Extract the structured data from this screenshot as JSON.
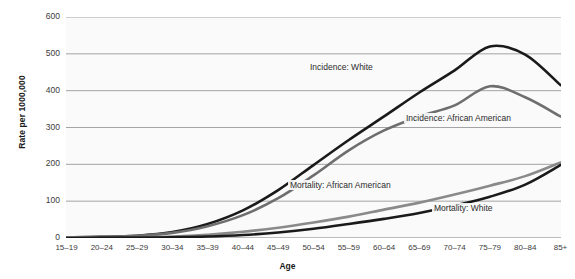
{
  "chart_data": {
    "type": "line",
    "title": "",
    "xlabel": "Age",
    "ylabel": "Rate per 1000,000",
    "categories": [
      "15–19",
      "20–24",
      "25–29",
      "30–34",
      "35–39",
      "40–44",
      "45–49",
      "50–54",
      "55–59",
      "60–64",
      "65–69",
      "70–74",
      "75–79",
      "80–84",
      "85+"
    ],
    "ylim": [
      0,
      600
    ],
    "yticks": [
      0,
      100,
      200,
      300,
      400,
      500,
      600
    ],
    "grid": true,
    "legend_position": "inline-annotations",
    "series": [
      {
        "name": "Incidence: White",
        "color": "#1a1a1a",
        "values": [
          2,
          3,
          6,
          16,
          38,
          75,
          130,
          198,
          266,
          330,
          395,
          455,
          520,
          498,
          415
        ]
      },
      {
        "name": "Incidence: African American",
        "color": "#6e6e6e",
        "values": [
          2,
          3,
          6,
          14,
          32,
          62,
          108,
          170,
          238,
          292,
          330,
          360,
          412,
          382,
          330
        ]
      },
      {
        "name": "Mortality: African American",
        "color": "#8a8a8a",
        "values": [
          1,
          1,
          2,
          4,
          9,
          17,
          28,
          42,
          58,
          77,
          96,
          118,
          142,
          168,
          205
        ]
      },
      {
        "name": "Mortality: White",
        "color": "#1a1a1a",
        "values": [
          0,
          1,
          1,
          2,
          4,
          8,
          15,
          25,
          38,
          52,
          68,
          88,
          112,
          145,
          198
        ]
      }
    ],
    "annotations": [
      {
        "text": "Incidence: White",
        "x_px": 308,
        "y_px": 62
      },
      {
        "text": "Incidence: African American",
        "x_px": 404,
        "y_px": 113
      },
      {
        "text": "Mortality: African American",
        "x_px": 288,
        "y_px": 180
      },
      {
        "text": "Mortality: White",
        "x_px": 432,
        "y_px": 203
      }
    ]
  },
  "axis": {
    "y_title": "Rate per 1000,000",
    "x_title": "Age"
  },
  "colors": {
    "incidence_white": "#1a1a1a",
    "incidence_african_american": "#6e6e6e",
    "mortality_african_american": "#8a8a8a",
    "mortality_white": "#1a1a1a",
    "grid": "#9a9a9a",
    "plot_bg": "#fafafa",
    "text": "#3b3b3b"
  }
}
